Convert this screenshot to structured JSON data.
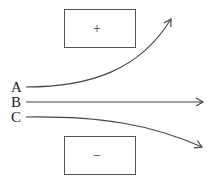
{
  "diagram": {
    "plates": {
      "positive": {
        "sign": "+"
      },
      "negative": {
        "sign": "−"
      }
    },
    "particles": [
      {
        "label": "A",
        "path": "deflected-up"
      },
      {
        "label": "B",
        "path": "straight"
      },
      {
        "label": "C",
        "path": "deflected-down"
      }
    ],
    "colors": {
      "stroke": "#444444",
      "text": "#222222",
      "background": "#ffffff"
    }
  }
}
